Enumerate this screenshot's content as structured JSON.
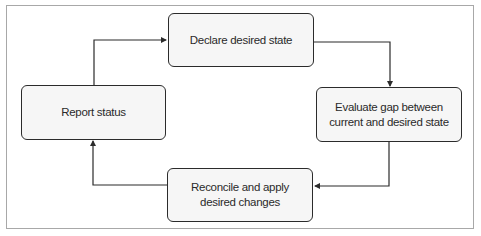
{
  "diagram": {
    "type": "cycle-flowchart",
    "nodes": [
      {
        "id": "declare",
        "label": "Declare desired state"
      },
      {
        "id": "evaluate",
        "label": "Evaluate gap between current and desired state"
      },
      {
        "id": "reconcile",
        "label": "Reconcile and apply desired changes"
      },
      {
        "id": "report",
        "label": "Report status"
      }
    ],
    "edges": [
      {
        "from": "declare",
        "to": "evaluate"
      },
      {
        "from": "evaluate",
        "to": "reconcile"
      },
      {
        "from": "reconcile",
        "to": "report"
      },
      {
        "from": "report",
        "to": "declare"
      }
    ],
    "colors": {
      "frame_border": "#a8a8a8",
      "node_border": "#2b2b2b",
      "node_fill": "#f6f6f6",
      "text": "#2a2a2a",
      "arrow": "#2b2b2b"
    }
  }
}
